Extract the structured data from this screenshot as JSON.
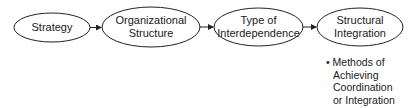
{
  "diagram": {
    "nodes": [
      {
        "id": "strategy",
        "lines": [
          "Strategy"
        ]
      },
      {
        "id": "organizational-structure",
        "lines": [
          "Organizational",
          "Structure"
        ]
      },
      {
        "id": "type-of-interdependence",
        "lines": [
          "Type of",
          "Interdependence"
        ]
      },
      {
        "id": "structural-integration",
        "lines": [
          "Structural",
          "Integration"
        ]
      }
    ],
    "edges": [
      {
        "from": "strategy",
        "to": "organizational-structure"
      },
      {
        "from": "organizational-structure",
        "to": "type-of-interdependence"
      },
      {
        "from": "type-of-interdependence",
        "to": "structural-integration"
      }
    ],
    "annotation": {
      "attached_to": "structural-integration",
      "bullet": "•",
      "lines": [
        "Methods of",
        "Achieving",
        "Coordination",
        "or Integration"
      ]
    },
    "colors": {
      "stroke": "#222222",
      "text": "#1a1a1a",
      "background": "#ffffff"
    }
  }
}
